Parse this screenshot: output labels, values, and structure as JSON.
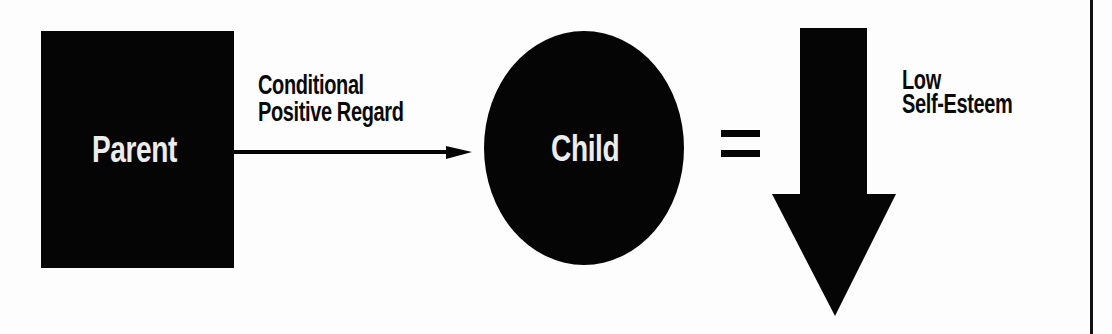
{
  "diagram": {
    "nodes": [
      {
        "id": "parent",
        "shape": "rectangle",
        "label": "Parent",
        "fill": "#050505",
        "text_color": "#ececec"
      },
      {
        "id": "child",
        "shape": "ellipse",
        "label": "Child",
        "fill": "#050505",
        "text_color": "#ececec"
      }
    ],
    "edges": [
      {
        "from": "parent",
        "to": "child",
        "label_lines": [
          "Conditional",
          "Positive Regard"
        ],
        "style": "solid-arrow"
      }
    ],
    "operator": {
      "symbol": "="
    },
    "outcome": {
      "shape": "down-arrow",
      "label_lines": [
        "Low",
        "Self-Esteem"
      ],
      "fill": "#050505"
    }
  },
  "colors": {
    "background": "#fdfdfd",
    "ink": "#050505",
    "node_text": "#ececec"
  }
}
